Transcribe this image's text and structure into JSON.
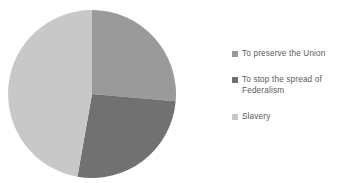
{
  "chart_data": {
    "type": "pie",
    "title": "",
    "subtitle": "",
    "xlabel": "",
    "ylabel": "",
    "grid": false,
    "legend_position": "right",
    "start_angle_deg": 0,
    "direction": "clockwise",
    "categories": [
      "To preserve the Union",
      "To stop the spread of Federalism",
      "Slavery"
    ],
    "values": [
      26,
      26,
      48
    ],
    "units": "percent",
    "colors": [
      "#9a9a9a",
      "#717171",
      "#c8c8c8"
    ],
    "slices": [
      {
        "label": "To preserve the Union",
        "value": 26,
        "color": "#9a9a9a",
        "start_deg": 0,
        "end_deg": 95
      },
      {
        "label": "To stop the spread of Federalism",
        "value": 26,
        "color": "#717171",
        "start_deg": 95,
        "end_deg": 190
      },
      {
        "label": "Slavery",
        "value": 48,
        "color": "#c8c8c8",
        "start_deg": 190,
        "end_deg": 360
      }
    ]
  },
  "legend": {
    "items": [
      {
        "marker": "legend-swatch-icon",
        "label": "To preserve the Union",
        "color": "#9a9a9a"
      },
      {
        "marker": "legend-swatch-icon",
        "label": "To stop the spread of\nFederalism",
        "color": "#717171"
      },
      {
        "marker": "legend-swatch-icon",
        "label": "Slavery",
        "color": "#c8c8c8"
      }
    ]
  },
  "style": {
    "background": "#ffffff",
    "text_color": "#5a5a5a"
  }
}
